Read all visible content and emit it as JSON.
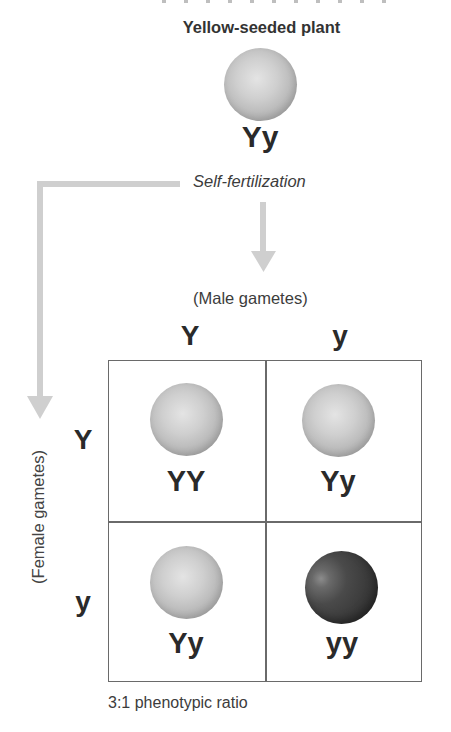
{
  "figure": {
    "parent": {
      "title": "Yellow-seeded plant",
      "genotype": "Yy",
      "seed_color": "yellow"
    },
    "process_label": "Self-fertilization",
    "male_gametes_label": "(Male gametes)",
    "female_gametes_label": "(Female gametes)",
    "male_gametes": [
      "Y",
      "y"
    ],
    "female_gametes": [
      "Y",
      "y"
    ],
    "punnett": {
      "rows": [
        [
          {
            "genotype": "YY",
            "phenotype": "yellow"
          },
          {
            "genotype": "Yy",
            "phenotype": "yellow"
          }
        ],
        [
          {
            "genotype": "Yy",
            "phenotype": "yellow"
          },
          {
            "genotype": "yy",
            "phenotype": "green"
          }
        ]
      ]
    },
    "caption": "3:1 phenotypic ratio"
  },
  "colors": {
    "light_seed": "#c4c4c4",
    "dark_seed": "#3a3a3a",
    "arrow": "#cfcfcf",
    "grid_line": "#6a6a6a"
  }
}
